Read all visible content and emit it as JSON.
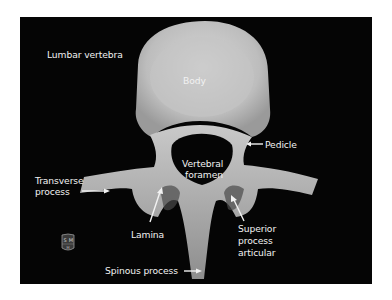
{
  "figure": {
    "title": "Lumbar vertebra",
    "background_color": "#050505",
    "bone_color": "#cfcfcf",
    "label_color": "#f2f2f2"
  },
  "labels": {
    "body": "Body",
    "pedicle": "Pedicle",
    "vertebral_foramen_line1": "Vertebral",
    "vertebral_foramen_line2": "foramen",
    "transverse_process_line1": "Transverse",
    "transverse_process_line2": "process",
    "lamina": "Lamina",
    "superior_process_line1": "Superior",
    "superior_process_line2": "process",
    "superior_process_line3": "articular",
    "spinous_process": "Spinous process"
  },
  "logo": {
    "icon": "shield-logo-icon",
    "letters_top": [
      "S",
      "M"
    ],
    "letter_bottom": "H"
  }
}
